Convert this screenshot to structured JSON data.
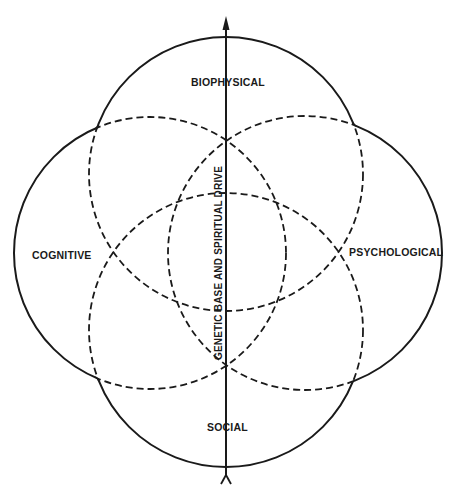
{
  "diagram": {
    "title": "",
    "labels": {
      "top": "BIOPHYSICAL",
      "left": "COGNITIVE",
      "right": "PSYCHOLOGICAL",
      "bottom": "SOCIAL",
      "axis": "GENETIC BASE AND SPIRITUAL DRIVE"
    },
    "circles": [
      {
        "name": "biophysical",
        "cx": 226,
        "cy": 174,
        "r": 137
      },
      {
        "name": "cognitive",
        "cx": 150,
        "cy": 253,
        "r": 136
      },
      {
        "name": "psychological",
        "cx": 305,
        "cy": 253,
        "r": 137
      },
      {
        "name": "social",
        "cx": 226,
        "cy": 330,
        "r": 137
      }
    ],
    "axis": {
      "x": 226,
      "y_top": 17,
      "y_bottom": 483,
      "head": "arrow-up",
      "tail": "fork"
    },
    "colors": {
      "ink": "#1a1a1a",
      "background": "#ffffff"
    }
  }
}
